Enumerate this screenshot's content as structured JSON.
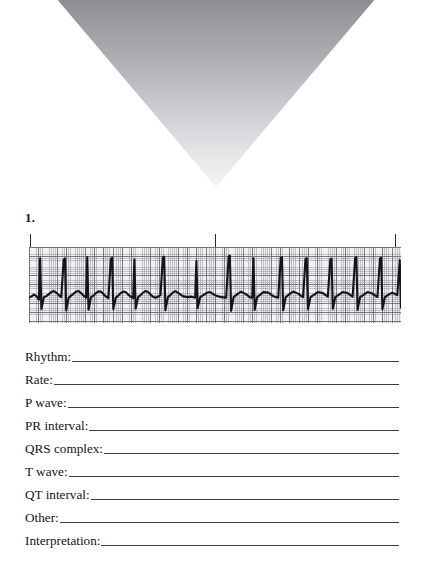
{
  "page": {
    "background_color": "#ffffff",
    "artifact": {
      "name": "scan-shadow-triangle",
      "shape": "downward-triangle",
      "top_color": "#8d8f93",
      "bottom_color": "#f0f0f1"
    }
  },
  "question": {
    "number_label": "1."
  },
  "ecg": {
    "paper_color": "#f2f2f2",
    "grid_minor_color": "#96969f",
    "grid_major_color": "#69697 3",
    "trace_color": "#1c1c1c",
    "tick_marks": [
      {
        "name": "interval-tick-0s",
        "x_pct": 0.3
      },
      {
        "name": "interval-tick-3s",
        "x_pct": 50.0
      },
      {
        "name": "interval-tick-6s",
        "x_pct": 98.5
      }
    ]
  },
  "chart_data": {
    "type": "line",
    "xlabel": "Time (s)",
    "ylabel": "Amplitude (mV)",
    "xlim": [
      0,
      6
    ],
    "ylim": [
      -1,
      2
    ],
    "grid": true,
    "legend": "none",
    "paper_speed_mm_per_s": 25,
    "gain_mm_per_mV": 10,
    "small_box_seconds": 0.04,
    "large_box_seconds": 0.2,
    "annotations": [
      "3-second interval markers at 0 s, 3 s, and 6 s"
    ],
    "beats_r_peak_times_s": [
      0.18,
      0.56,
      0.94,
      1.32,
      1.7,
      2.16,
      2.7,
      3.22,
      3.62,
      4.06,
      4.46,
      4.86,
      5.26,
      5.66,
      5.98
    ],
    "series": [
      {
        "name": "Lead II",
        "x": [
          0.0,
          0.04,
          0.08,
          0.12,
          0.16,
          0.18,
          0.2,
          0.24,
          0.28,
          0.32,
          0.36,
          0.4,
          0.44,
          0.48,
          0.52,
          0.56,
          0.58,
          0.6,
          0.64,
          0.68,
          0.72,
          0.76,
          0.8,
          0.84,
          0.88,
          0.92,
          0.94,
          0.96,
          1.0,
          1.04,
          1.08,
          1.12,
          1.16,
          1.2,
          1.24,
          1.28,
          1.32,
          1.34,
          1.36,
          1.4,
          1.44,
          1.48,
          1.52,
          1.56,
          1.6,
          1.64,
          1.68,
          1.7,
          1.72,
          1.76,
          1.8,
          1.84,
          1.88,
          1.92,
          1.96,
          2.0,
          2.04,
          2.08,
          2.12,
          2.16,
          2.18,
          2.2,
          2.24,
          2.28,
          2.32,
          2.36,
          2.4,
          2.48,
          2.56,
          2.62,
          2.68,
          2.7,
          2.72,
          2.76,
          2.8,
          2.86,
          2.92,
          3.0,
          3.1,
          3.18,
          3.22,
          3.24,
          3.26,
          3.3,
          3.36,
          3.42,
          3.5,
          3.56,
          3.6,
          3.62,
          3.64,
          3.68,
          3.72,
          3.78,
          3.86,
          3.94,
          4.02,
          4.06,
          4.08,
          4.1,
          4.14,
          4.2,
          4.26,
          4.34,
          4.42,
          4.46,
          4.48,
          4.5,
          4.54,
          4.6,
          4.66,
          4.74,
          4.82,
          4.86,
          4.88,
          4.9,
          4.94,
          5.0,
          5.06,
          5.14,
          5.22,
          5.26,
          5.28,
          5.3,
          5.34,
          5.4,
          5.46,
          5.54,
          5.62,
          5.66,
          5.68,
          5.7,
          5.74,
          5.8,
          5.86,
          5.94,
          5.98,
          6.0
        ],
        "y": [
          0.0,
          0.05,
          0.12,
          0.06,
          -0.08,
          1.55,
          -0.45,
          0.02,
          0.06,
          0.14,
          0.22,
          0.26,
          0.2,
          0.1,
          0.02,
          1.5,
          1.55,
          -0.5,
          0.0,
          0.08,
          0.16,
          0.24,
          0.26,
          0.18,
          0.08,
          0.0,
          1.6,
          -0.48,
          0.02,
          0.08,
          0.18,
          0.25,
          0.24,
          0.14,
          0.05,
          -0.02,
          1.52,
          1.58,
          -0.46,
          0.0,
          0.08,
          0.18,
          0.24,
          0.22,
          0.12,
          0.04,
          -0.02,
          1.5,
          -0.44,
          0.02,
          0.1,
          0.2,
          0.26,
          0.22,
          0.12,
          0.04,
          0.0,
          0.04,
          0.1,
          1.58,
          1.62,
          -0.5,
          0.02,
          0.1,
          0.2,
          0.26,
          0.2,
          0.06,
          0.02,
          0.04,
          0.0,
          1.45,
          -0.42,
          0.02,
          0.08,
          0.18,
          0.22,
          0.1,
          0.02,
          0.0,
          1.62,
          1.66,
          -0.52,
          0.02,
          0.14,
          0.24,
          0.14,
          0.02,
          0.0,
          1.55,
          -0.48,
          0.02,
          0.1,
          0.22,
          0.2,
          0.06,
          0.0,
          1.58,
          1.6,
          -0.5,
          0.02,
          0.14,
          0.24,
          0.16,
          0.02,
          1.52,
          1.56,
          -0.46,
          0.02,
          0.12,
          0.22,
          0.18,
          0.04,
          1.5,
          1.54,
          -0.44,
          0.02,
          0.12,
          0.22,
          0.18,
          0.04,
          1.56,
          1.6,
          -0.48,
          0.02,
          0.12,
          0.22,
          0.16,
          0.02,
          1.54,
          1.58,
          -0.46,
          0.02,
          0.12,
          0.2,
          0.1,
          1.48,
          -0.4
        ]
      }
    ]
  },
  "form": {
    "fields": [
      {
        "name": "rhythm",
        "label": "Rhythm:",
        "value": ""
      },
      {
        "name": "rate",
        "label": "Rate:",
        "value": ""
      },
      {
        "name": "p-wave",
        "label": "P wave:",
        "value": ""
      },
      {
        "name": "pr-interval",
        "label": "PR interval:",
        "value": ""
      },
      {
        "name": "qrs-complex",
        "label": "QRS complex:",
        "value": ""
      },
      {
        "name": "t-wave",
        "label": "T wave:",
        "value": ""
      },
      {
        "name": "qt-interval",
        "label": "QT interval:",
        "value": ""
      },
      {
        "name": "other",
        "label": "Other:",
        "value": ""
      },
      {
        "name": "interpretation",
        "label": "Interpretation:",
        "value": ""
      }
    ]
  }
}
